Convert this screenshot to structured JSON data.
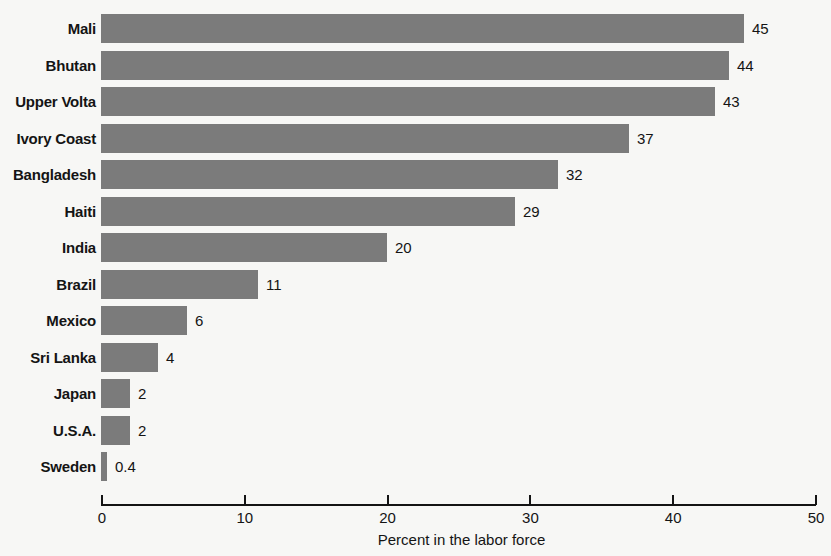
{
  "chart_data": {
    "type": "bar",
    "orientation": "horizontal",
    "title": "",
    "xlabel": "Percent in the labor force",
    "ylabel": "",
    "xlim": [
      0,
      50
    ],
    "xticks": [
      0,
      10,
      20,
      30,
      40,
      50
    ],
    "xtick_labels": [
      "0",
      "10",
      "20",
      "30",
      "40",
      "50"
    ],
    "grid": false,
    "legend": null,
    "bar_color": "#7b7b7b",
    "background_color": "#f7f7f5",
    "text_color": "#141414",
    "categories": [
      "Mali",
      "Bhutan",
      "Upper Volta",
      "Ivory Coast",
      "Bangladesh",
      "Haiti",
      "India",
      "Brazil",
      "Mexico",
      "Sri Lanka",
      "Japan",
      "U.S.A.",
      "Sweden"
    ],
    "values": [
      45,
      44,
      43,
      37,
      32,
      29,
      20,
      11,
      6,
      4,
      2,
      2,
      0.4
    ],
    "value_labels": [
      "45",
      "44",
      "43",
      "37",
      "32",
      "29",
      "20",
      "11",
      "6",
      "4",
      "2",
      "2",
      "0.4"
    ]
  }
}
